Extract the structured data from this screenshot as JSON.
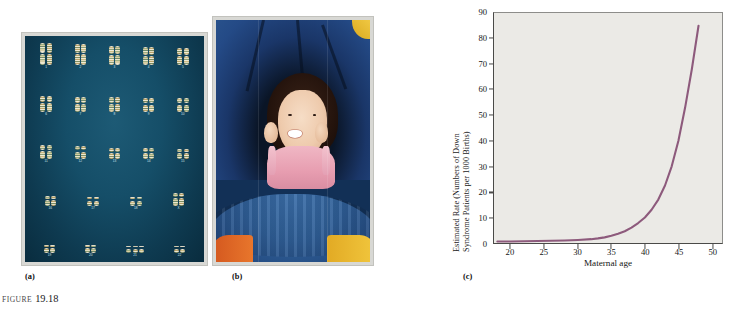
{
  "figure": {
    "caption_prefix": "FIGURE",
    "number": "19.18"
  },
  "panels": [
    {
      "tag": "(a)",
      "name": "karyotype-photograph",
      "description": "Karyotype showing trisomy 21"
    },
    {
      "tag": "(b)",
      "name": "child-photograph",
      "description": "Photograph of a child with Down syndrome"
    },
    {
      "tag": "(c)",
      "name": "incidence-chart",
      "description": "Estimated rate of Down syndrome versus maternal age"
    }
  ],
  "karyotype": {
    "background_color": "#11455d",
    "rows": [
      {
        "groups": [
          {
            "label": "1",
            "count": 2,
            "height": 22
          },
          {
            "label": "2",
            "count": 2,
            "height": 21
          },
          {
            "label": "3",
            "count": 2,
            "height": 19
          },
          {
            "label": "4",
            "count": 2,
            "height": 18
          },
          {
            "label": "5",
            "count": 2,
            "height": 17
          }
        ]
      },
      {
        "groups": [
          {
            "label": "6",
            "count": 2,
            "height": 16
          },
          {
            "label": "7",
            "count": 2,
            "height": 15
          },
          {
            "label": "8",
            "count": 2,
            "height": 15
          },
          {
            "label": "9",
            "count": 2,
            "height": 14
          },
          {
            "label": "10",
            "count": 2,
            "height": 14
          }
        ]
      },
      {
        "groups": [
          {
            "label": "11",
            "count": 2,
            "height": 14
          },
          {
            "label": "12",
            "count": 2,
            "height": 13
          },
          {
            "label": "13",
            "count": 2,
            "height": 11
          },
          {
            "label": "14",
            "count": 2,
            "height": 11
          },
          {
            "label": "15",
            "count": 2,
            "height": 10
          }
        ]
      },
      {
        "groups": [
          {
            "label": "16",
            "count": 2,
            "height": 10
          },
          {
            "label": "17",
            "count": 2,
            "height": 9
          },
          {
            "label": "18",
            "count": 2,
            "height": 9
          },
          {
            "label": "X",
            "count": 2,
            "height": 13
          }
        ]
      },
      {
        "groups": [
          {
            "label": "19",
            "count": 2,
            "height": 8
          },
          {
            "label": "20",
            "count": 2,
            "height": 8
          },
          {
            "label": "21",
            "count": 3,
            "height": 7
          },
          {
            "label": "22",
            "count": 2,
            "height": 7
          }
        ]
      }
    ]
  },
  "chart_data": {
    "type": "line",
    "title": "",
    "xlabel": "Maternal age",
    "ylabel": "Estimated Rate (Numbers of Down Syndrome Patients per 1000 Births)",
    "ylabel_line1": "Estimated Rate (Numbers of Down",
    "ylabel_line2": "Syndrome Patients per 1000 Births)",
    "xlim": [
      17.5,
      51.5
    ],
    "ylim": [
      0,
      90
    ],
    "xticks": [
      20,
      25,
      30,
      35,
      40,
      45,
      50
    ],
    "yticks": [
      0,
      10,
      20,
      30,
      40,
      50,
      60,
      70,
      80,
      90
    ],
    "grid": false,
    "legend": null,
    "line_color": "#8d5a7c",
    "plot_background": "#ebeae6",
    "series": [
      {
        "name": "Down syndrome rate per 1000 births",
        "x": [
          18,
          20,
          22,
          24,
          26,
          28,
          30,
          32,
          33,
          34,
          35,
          36,
          37,
          38,
          39,
          40,
          41,
          42,
          43,
          44,
          45,
          46,
          47,
          48
        ],
        "y": [
          0.6,
          0.6,
          0.7,
          0.8,
          0.9,
          1.0,
          1.2,
          1.5,
          1.8,
          2.2,
          2.8,
          3.6,
          4.6,
          6.0,
          7.8,
          10.0,
          13.0,
          17.0,
          22.5,
          30.0,
          40.0,
          53.0,
          68.0,
          85.0
        ]
      }
    ]
  }
}
